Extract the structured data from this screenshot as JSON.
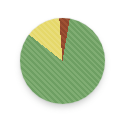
{
  "canvas": {
    "width_px": 128,
    "height_px": 122,
    "background": "#ffffff"
  },
  "chart_data": {
    "type": "pie",
    "title": "",
    "legend": "none",
    "labels_visible": false,
    "direction": "clockwise",
    "rotation_from_top_deg": 9.7,
    "segments": [
      {
        "name": "green",
        "value_pct": 82.9,
        "color": "#74a468"
      },
      {
        "name": "yellow",
        "value_pct": 13.2,
        "color": "#e7da70"
      },
      {
        "name": "brown",
        "value_pct": 3.9,
        "color": "#94492e"
      }
    ]
  }
}
